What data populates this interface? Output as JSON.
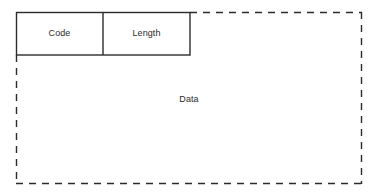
{
  "diagram": {
    "type": "packet-format-diagram",
    "background_color": "#ffffff",
    "line_color": "#2b2b2b",
    "fields": [
      {
        "id": "code",
        "label": "Code",
        "border_style": "solid"
      },
      {
        "id": "length",
        "label": "Length",
        "border_style": "solid"
      },
      {
        "id": "data",
        "label": "Data",
        "border_style": "dashed"
      }
    ]
  }
}
